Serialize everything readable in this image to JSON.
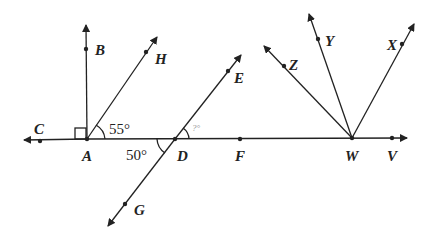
{
  "diagram": {
    "points": {
      "A": "A",
      "B": "B",
      "C": "C",
      "D": "D",
      "E": "E",
      "F": "F",
      "G": "G",
      "H": "H",
      "V": "V",
      "W": "W",
      "X": "X",
      "Y": "Y",
      "Z": "Z"
    },
    "angles": {
      "HAF": "55°",
      "ADG": "50°",
      "EDF": "?°"
    },
    "colors": {
      "ink": "#222222",
      "background": "#ffffff"
    }
  }
}
